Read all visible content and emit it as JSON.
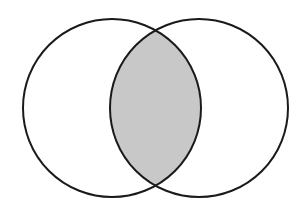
{
  "diagram": {
    "type": "venn",
    "colors": {
      "background": "#ffffff",
      "stroke": "#1a1a1a",
      "intersection_fill": "#c8c8c8",
      "circle_fill": "#ffffff"
    },
    "stroke_width": 2,
    "sets": [
      {
        "id": "A",
        "cx": 112,
        "cy": 108,
        "r": 89
      },
      {
        "id": "B",
        "cx": 199,
        "cy": 108,
        "r": 89
      }
    ],
    "shaded_region": "A∩B"
  }
}
